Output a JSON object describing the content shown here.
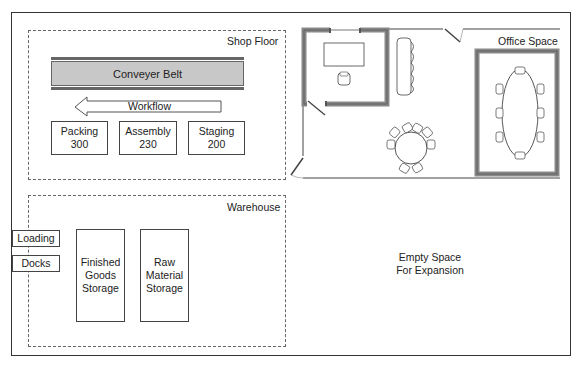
{
  "diagram": {
    "zones": {
      "shop_floor": {
        "label": "Shop Floor",
        "conveyor_label": "Conveyer Belt",
        "workflow_label": "Workflow",
        "stations": [
          {
            "name": "Packing",
            "number": "300",
            "text": "Packing\n300"
          },
          {
            "name": "Assembly",
            "number": "230",
            "text": "Assembly\n230"
          },
          {
            "name": "Staging",
            "number": "200",
            "text": "Staging\n200"
          }
        ]
      },
      "office": {
        "label": "Office Space"
      },
      "warehouse": {
        "label": "Warehouse",
        "docks": [
          "Loading",
          "Docks"
        ],
        "storage": [
          {
            "text": "Finished\nGoods\nStorage"
          },
          {
            "text": "Raw\nMaterial\nStorage"
          }
        ]
      },
      "expansion": {
        "text": "Empty Space\nFor Expansion"
      }
    },
    "colors": {
      "wall_fill": "#bdbdbd",
      "conveyor_fill": "#c8c8c8",
      "line": "#333333"
    }
  }
}
